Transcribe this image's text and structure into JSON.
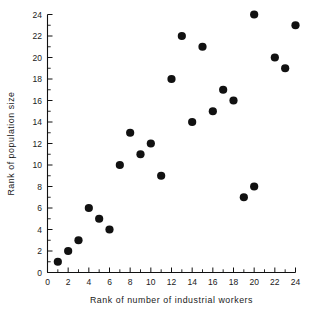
{
  "chart_data": {
    "type": "scatter",
    "title": "",
    "xlabel": "Rank of number of industrial workers",
    "ylabel": "Rank of population size",
    "xlim": [
      0,
      24
    ],
    "ylim": [
      0,
      24
    ],
    "grid": false,
    "legend": null,
    "x_ticks": [
      0,
      2,
      4,
      6,
      8,
      10,
      12,
      14,
      16,
      18,
      20,
      22,
      24
    ],
    "y_ticks": [
      0,
      2,
      4,
      6,
      8,
      10,
      12,
      14,
      16,
      18,
      20,
      22,
      24
    ],
    "x_tick_labels": [
      "0",
      "2",
      "4",
      "6",
      "8",
      "10",
      "12",
      "14",
      "16",
      "18",
      "20",
      "22",
      "24"
    ],
    "y_tick_labels": [
      "0",
      "2",
      "4",
      "6",
      "8",
      "10",
      "12",
      "14",
      "16",
      "18",
      "20",
      "22",
      "24"
    ],
    "x_minor_step": 1,
    "y_minor_step": 1,
    "marker": "filled-circle",
    "marker_color": "#111111",
    "marker_size_px": 4.1,
    "points": [
      {
        "x": 1,
        "y": 1
      },
      {
        "x": 2,
        "y": 2
      },
      {
        "x": 3,
        "y": 3
      },
      {
        "x": 4,
        "y": 6
      },
      {
        "x": 5,
        "y": 5
      },
      {
        "x": 6,
        "y": 4
      },
      {
        "x": 7,
        "y": 10
      },
      {
        "x": 8,
        "y": 13
      },
      {
        "x": 9,
        "y": 11
      },
      {
        "x": 10,
        "y": 12
      },
      {
        "x": 11,
        "y": 9
      },
      {
        "x": 12,
        "y": 18
      },
      {
        "x": 13,
        "y": 22
      },
      {
        "x": 14,
        "y": 14
      },
      {
        "x": 15,
        "y": 21
      },
      {
        "x": 16,
        "y": 15
      },
      {
        "x": 17,
        "y": 17
      },
      {
        "x": 18,
        "y": 16
      },
      {
        "x": 19,
        "y": 7
      },
      {
        "x": 20,
        "y": 8
      },
      {
        "x": 20,
        "y": 24
      },
      {
        "x": 22,
        "y": 20
      },
      {
        "x": 23,
        "y": 19
      },
      {
        "x": 24,
        "y": 23
      }
    ],
    "x_values": [
      1,
      2,
      3,
      4,
      5,
      6,
      7,
      8,
      9,
      10,
      11,
      12,
      13,
      14,
      15,
      16,
      17,
      18,
      19,
      20,
      20,
      22,
      23,
      24
    ],
    "y_values": [
      1,
      2,
      3,
      6,
      5,
      4,
      10,
      13,
      11,
      12,
      9,
      18,
      22,
      14,
      21,
      15,
      17,
      16,
      7,
      8,
      24,
      20,
      19,
      23
    ]
  },
  "colors": {
    "background": "#ffffff",
    "axis": "#111111",
    "text": "#1a1a1a",
    "marker": "#111111"
  }
}
